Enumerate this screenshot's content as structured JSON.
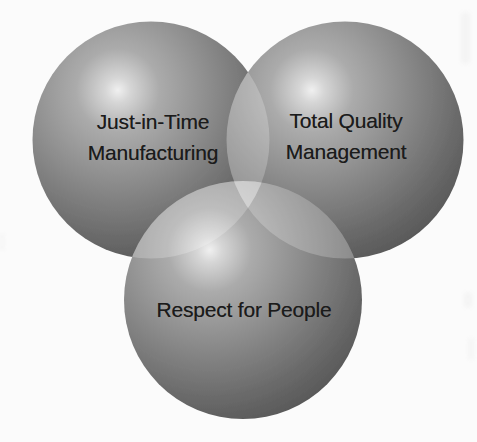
{
  "page": {
    "background_color": "#fbfbfb"
  },
  "venn": {
    "type": "venn-diagram",
    "text_color": "#1b1b1b",
    "sphere": {
      "gradient_stops": [
        "#f0f0f0",
        "#d6d6d6",
        "#ababab",
        "#8f8f8f",
        "#6b6b6b",
        "#484848"
      ],
      "overlap_color": "#ffffff",
      "overlap_opacity": "0.22"
    },
    "circles": [
      {
        "id": "just-in-time-manufacturing",
        "lines": [
          "Just-in-Time",
          "Manufacturing"
        ]
      },
      {
        "id": "total-quality-management",
        "lines": [
          "Total Quality",
          "Management"
        ]
      },
      {
        "id": "respect-for-people",
        "lines": [
          "Respect for People"
        ]
      }
    ]
  }
}
